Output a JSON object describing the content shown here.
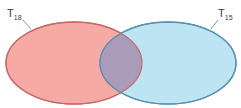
{
  "diagram": {
    "type": "venn",
    "sets": [
      {
        "name": "T18",
        "label_main": "T",
        "label_sub": "18",
        "fill": "#f5a9a5",
        "stroke": "#d9655c"
      },
      {
        "name": "T15",
        "label_main": "T",
        "label_sub": "15",
        "fill": "#b9e3f2",
        "stroke": "#4f95b8"
      }
    ],
    "intersection": {
      "fill": "#a79ab8"
    }
  }
}
